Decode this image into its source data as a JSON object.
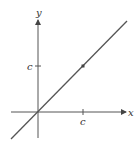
{
  "diagram": {
    "axes": {
      "x_label": "x",
      "y_label": "y"
    },
    "ticks": {
      "x_tick_label": "c",
      "y_tick_label": "c"
    },
    "line": {
      "description": "y = x",
      "point": "(c, c)"
    },
    "colors": {
      "stroke": "#555555",
      "text": "#333333",
      "background": "#ffffff"
    }
  }
}
